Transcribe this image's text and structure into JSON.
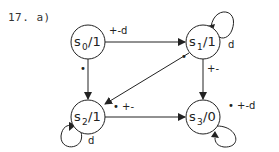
{
  "title": "17. a)",
  "states": [
    {
      "id": "s0",
      "name": "s",
      "sub": "0",
      "output": "/1",
      "cx": 88,
      "cy": 42
    },
    {
      "id": "s1",
      "name": "s",
      "sub": "1",
      "output": "/1",
      "cx": 203,
      "cy": 42
    },
    {
      "id": "s2",
      "name": "s",
      "sub": "2",
      "output": "/1",
      "cx": 88,
      "cy": 117
    },
    {
      "id": "s3",
      "name": "s",
      "sub": "3",
      "output": "/0",
      "cx": 203,
      "cy": 117
    }
  ],
  "edges": [
    {
      "from": "s0",
      "to": "s1",
      "label": "+-d"
    },
    {
      "from": "s0",
      "to": "s2",
      "label": "•"
    },
    {
      "from": "s1",
      "to": "s1",
      "label": "d"
    },
    {
      "from": "s1",
      "to": "s2",
      "label": "•"
    },
    {
      "from": "s1",
      "to": "s3",
      "label": "+-"
    },
    {
      "from": "s2",
      "to": "s2",
      "label": "d"
    },
    {
      "from": "s2",
      "to": "s3",
      "label": "• +-"
    },
    {
      "from": "s3",
      "to": "s3",
      "label": "• +-d"
    }
  ],
  "colors": {
    "stroke": "#222222",
    "background": "#ffffff"
  }
}
